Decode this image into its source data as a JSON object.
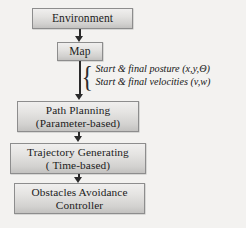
{
  "diagram": {
    "type": "flowchart",
    "background_color": "#f3f2f0",
    "box_border_color": "#8d8d8d",
    "arrow_color": "#2a2a2a",
    "nodes": [
      {
        "id": "environment",
        "lines": [
          "Environment"
        ]
      },
      {
        "id": "map",
        "lines": [
          "Map"
        ]
      },
      {
        "id": "path_planning",
        "lines": [
          "Path Planning",
          "(Parameter-based)"
        ]
      },
      {
        "id": "trajectory_generating",
        "lines": [
          "Trajectory Generating",
          "( Time-based)"
        ]
      },
      {
        "id": "obstacles_avoidance",
        "lines": [
          "Obstacles Avoidance",
          "Controller"
        ]
      }
    ],
    "annotation": {
      "brace": "{",
      "lines": [
        "Start & final posture (x,y,Θ)",
        "Start & final velocities (v,w)"
      ]
    },
    "edges": [
      {
        "from": "environment",
        "to": "map"
      },
      {
        "from": "map",
        "to": "path_planning"
      },
      {
        "from": "path_planning",
        "to": "trajectory_generating"
      },
      {
        "from": "trajectory_generating",
        "to": "obstacles_avoidance"
      }
    ]
  }
}
